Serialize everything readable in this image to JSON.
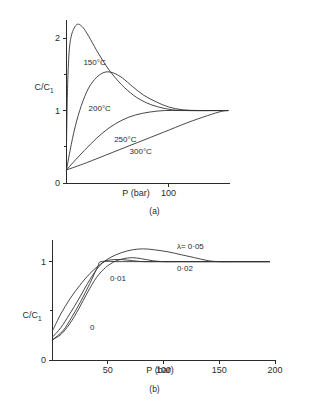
{
  "running_head": "GAS TREATMENT PROCESSES",
  "figures": [
    {
      "id": "a",
      "caption": "(a)",
      "chart_data": {
        "type": "line",
        "title": "",
        "xlabel": "P  (bar)",
        "ylabel": "C/C",
        "ylabel_sub": "1",
        "xlim": [
          0,
          160
        ],
        "ylim": [
          0,
          2.25
        ],
        "xticks": [
          100
        ],
        "xtick_labels": [
          "100"
        ],
        "yticks": [
          0,
          1,
          2
        ],
        "ytick_labels": [
          "0",
          "1",
          "2"
        ],
        "yminor_ticks": [
          0.5,
          1.5
        ],
        "grid": false,
        "legend": "inline-annotations",
        "series": [
          {
            "name": "150°C",
            "label": "150°C",
            "label_x": 17,
            "label_y": 1.63,
            "points": [
              [
                0.5,
                0.55
              ],
              [
                1.5,
                1.3
              ],
              [
                3,
                1.8
              ],
              [
                5,
                2.02
              ],
              [
                8,
                2.14
              ],
              [
                11,
                2.19
              ],
              [
                14,
                2.18
              ],
              [
                18,
                2.12
              ],
              [
                24,
                1.98
              ],
              [
                32,
                1.78
              ],
              [
                42,
                1.56
              ],
              [
                54,
                1.36
              ],
              [
                66,
                1.21
              ],
              [
                78,
                1.11
              ],
              [
                90,
                1.05
              ],
              [
                104,
                1.01
              ],
              [
                120,
                1.0
              ],
              [
                140,
                1.0
              ],
              [
                158,
                1.0
              ]
            ]
          },
          {
            "name": "200°C",
            "label": "200°C",
            "label_x": 22,
            "label_y": 0.99,
            "points": [
              [
                0.5,
                0.18
              ],
              [
                4,
                0.45
              ],
              [
                9,
                0.78
              ],
              [
                15,
                1.07
              ],
              [
                22,
                1.31
              ],
              [
                30,
                1.46
              ],
              [
                38,
                1.53
              ],
              [
                46,
                1.52
              ],
              [
                55,
                1.45
              ],
              [
                65,
                1.33
              ],
              [
                76,
                1.21
              ],
              [
                88,
                1.12
              ],
              [
                100,
                1.05
              ],
              [
                114,
                1.01
              ],
              [
                130,
                1.0
              ],
              [
                145,
                1.0
              ],
              [
                158,
                1.0
              ]
            ]
          },
          {
            "name": "250°C",
            "label": "250°C",
            "label_x": 47,
            "label_y": 0.56,
            "points": [
              [
                0.5,
                0.18
              ],
              [
                8,
                0.3
              ],
              [
                18,
                0.45
              ],
              [
                30,
                0.62
              ],
              [
                42,
                0.76
              ],
              [
                55,
                0.87
              ],
              [
                68,
                0.94
              ],
              [
                82,
                0.98
              ],
              [
                96,
                1.0
              ],
              [
                112,
                1.0
              ],
              [
                130,
                1.0
              ],
              [
                158,
                1.0
              ]
            ]
          },
          {
            "name": "300°C",
            "label": "300°C",
            "label_x": 62,
            "label_y": 0.4,
            "points": [
              [
                0.5,
                0.18
              ],
              [
                20,
                0.28
              ],
              [
                45,
                0.42
              ],
              [
                70,
                0.56
              ],
              [
                95,
                0.7
              ],
              [
                118,
                0.83
              ],
              [
                138,
                0.93
              ],
              [
                152,
                0.99
              ],
              [
                158,
                1.0
              ]
            ]
          }
        ]
      }
    },
    {
      "id": "b",
      "caption": "(b)",
      "chart_data": {
        "type": "line",
        "title": "",
        "xlabel": "P (bar)",
        "ylabel": "C/C",
        "ylabel_sub": "1",
        "xlim": [
          0,
          200
        ],
        "ylim": [
          0,
          1.22
        ],
        "xticks": [
          50,
          100,
          150,
          200
        ],
        "xtick_labels": [
          "50",
          "100",
          "150",
          "200"
        ],
        "yticks": [
          0,
          1
        ],
        "ytick_labels": [
          "0",
          "1"
        ],
        "yminor_ticks": [
          0.5
        ],
        "grid": false,
        "legend": "inline-annotations",
        "series": [
          {
            "name": "lambda = 0.05",
            "label": "λ= 0·05",
            "label_x": 112,
            "label_y": 1.13,
            "points": [
              [
                1,
                0.31
              ],
              [
                8,
                0.47
              ],
              [
                16,
                0.62
              ],
              [
                25,
                0.76
              ],
              [
                34,
                0.88
              ],
              [
                43,
                0.97
              ],
              [
                52,
                1.04
              ],
              [
                62,
                1.09
              ],
              [
                72,
                1.12
              ],
              [
                82,
                1.13
              ],
              [
                92,
                1.12
              ],
              [
                104,
                1.1
              ],
              [
                116,
                1.07
              ],
              [
                128,
                1.04
              ],
              [
                140,
                1.01
              ],
              [
                150,
                1.0
              ],
              [
                165,
                1.0
              ],
              [
                180,
                1.0
              ],
              [
                195,
                1.0
              ]
            ]
          },
          {
            "name": "0.02",
            "label": "0·02",
            "label_x": 112,
            "label_y": 0.9,
            "points": [
              [
                1,
                0.21
              ],
              [
                8,
                0.26
              ],
              [
                16,
                0.37
              ],
              [
                24,
                0.52
              ],
              [
                32,
                0.69
              ],
              [
                40,
                0.84
              ],
              [
                48,
                0.94
              ],
              [
                56,
                1.0
              ],
              [
                64,
                1.03
              ],
              [
                72,
                1.04
              ],
              [
                80,
                1.03
              ],
              [
                90,
                1.01
              ],
              [
                100,
                1.0
              ],
              [
                115,
                1.0
              ],
              [
                135,
                1.0
              ],
              [
                160,
                1.0
              ],
              [
                180,
                1.0
              ],
              [
                195,
                1.0
              ]
            ]
          },
          {
            "name": "0.01",
            "label": "0·01",
            "label_x": 52,
            "label_y": 0.8,
            "points": [
              [
                1,
                0.24
              ],
              [
                8,
                0.33
              ],
              [
                16,
                0.47
              ],
              [
                24,
                0.62
              ],
              [
                32,
                0.78
              ],
              [
                40,
                0.92
              ],
              [
                47,
                1.0
              ],
              [
                55,
                1.02
              ],
              [
                63,
                1.02
              ],
              [
                72,
                1.01
              ],
              [
                82,
                1.0
              ],
              [
                95,
                1.0
              ],
              [
                115,
                1.0
              ],
              [
                140,
                1.0
              ],
              [
                170,
                1.0
              ],
              [
                195,
                1.0
              ]
            ]
          },
          {
            "name": "0",
            "label": "0",
            "label_x": 34,
            "label_y": 0.3,
            "points": [
              [
                1,
                0.21
              ],
              [
                10,
                0.3
              ],
              [
                18,
                0.44
              ],
              [
                26,
                0.6
              ],
              [
                34,
                0.78
              ],
              [
                41,
                0.95
              ],
              [
                44,
                1.0
              ],
              [
                60,
                1.0
              ],
              [
                90,
                1.0
              ],
              [
                130,
                1.0
              ],
              [
                165,
                1.0
              ],
              [
                195,
                1.0
              ]
            ]
          }
        ]
      }
    }
  ]
}
